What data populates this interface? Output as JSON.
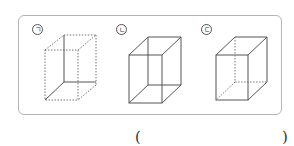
{
  "figures": [
    {
      "label": "ㄱ",
      "style": "hidden edges solid, visible edges dashed"
    },
    {
      "label": "ㄴ",
      "style": "all edges solid"
    },
    {
      "label": "ㄷ",
      "style": "visible edges solid, hidden edges dashed"
    }
  ],
  "answer": {
    "open": "(",
    "close": ")"
  },
  "colors": {
    "line": "#555555",
    "border": "#b5b5b5"
  }
}
